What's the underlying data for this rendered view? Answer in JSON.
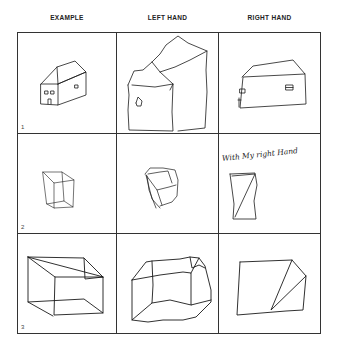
{
  "figure": {
    "columns": [
      {
        "label": "EXAMPLE"
      },
      {
        "label": "LEFT HAND"
      },
      {
        "label": "RIGHT HAND"
      }
    ],
    "rows": [
      {
        "number": "1",
        "subject": "house",
        "cells": [
          "example-house",
          "left-hand-house",
          "right-hand-house"
        ]
      },
      {
        "number": "2",
        "subject": "small cube",
        "cells": [
          "example-small-cube",
          "left-hand-small-cube",
          "right-hand-small-cube"
        ]
      },
      {
        "number": "3",
        "subject": "large cube",
        "cells": [
          "example-large-cube",
          "left-hand-large-cube",
          "right-hand-large-cube"
        ]
      }
    ],
    "annotation": "With My right Hand"
  }
}
